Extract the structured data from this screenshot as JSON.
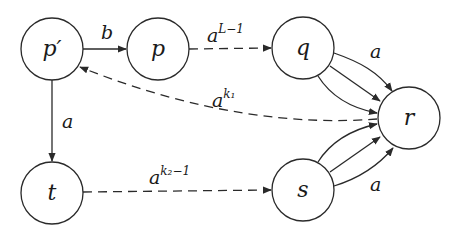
{
  "diagram": {
    "type": "automaton",
    "colors": {
      "stroke": "#2a2a2a",
      "text": "#1a1a1a",
      "background": "#ffffff"
    },
    "nodes": [
      {
        "id": "p_prime",
        "label": "p′",
        "cx": 52,
        "cy": 49
      },
      {
        "id": "p",
        "label": "p",
        "cx": 158,
        "cy": 49
      },
      {
        "id": "q",
        "label": "q",
        "cx": 303,
        "cy": 48
      },
      {
        "id": "r",
        "label": "r",
        "cx": 409,
        "cy": 118
      },
      {
        "id": "t",
        "label": "t",
        "cx": 52,
        "cy": 193
      },
      {
        "id": "s",
        "label": "s",
        "cx": 303,
        "cy": 190
      }
    ],
    "edges": [
      {
        "from": "p_prime",
        "to": "p",
        "style": "solid",
        "label": {
          "base": "b",
          "sup": ""
        }
      },
      {
        "from": "p",
        "to": "q",
        "style": "dashed",
        "label": {
          "base": "a",
          "sup": "L−1"
        }
      },
      {
        "from": "p_prime",
        "to": "t",
        "style": "solid",
        "label": {
          "base": "a",
          "sup": ""
        }
      },
      {
        "from": "r",
        "to": "p_prime",
        "style": "dashed",
        "label": {
          "base": "a",
          "sup": "k₁"
        }
      },
      {
        "from": "t",
        "to": "s",
        "style": "dashed",
        "label": {
          "base": "a",
          "sup": "k₂−1"
        }
      },
      {
        "from": "q",
        "to": "r",
        "style": "solid",
        "multiplicity": 3,
        "label": {
          "base": "a",
          "sup": ""
        }
      },
      {
        "from": "s",
        "to": "r",
        "style": "solid",
        "multiplicity": 3,
        "label": {
          "base": "a",
          "sup": ""
        }
      }
    ]
  }
}
